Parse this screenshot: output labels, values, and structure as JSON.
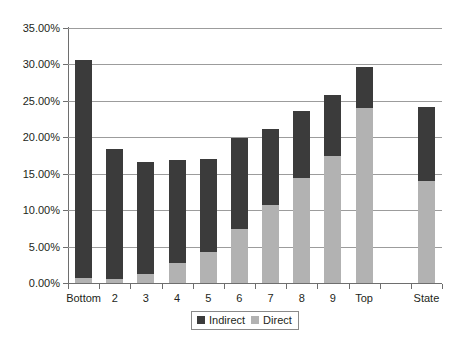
{
  "chart_data": {
    "type": "bar",
    "subtype": "stacked-column",
    "title": "",
    "xlabel": "",
    "ylabel": "",
    "categories": [
      "Bottom",
      "2",
      "3",
      "4",
      "5",
      "6",
      "7",
      "8",
      "9",
      "Top",
      "State"
    ],
    "series": [
      {
        "name": "Direct",
        "color": "#b2b2b2",
        "values": [
          0.7,
          0.5,
          1.2,
          2.7,
          4.2,
          7.4,
          10.7,
          14.4,
          17.5,
          24.0,
          14.0
        ]
      },
      {
        "name": "Indirect",
        "color": "#3b3b3b",
        "values": [
          29.9,
          17.9,
          15.4,
          14.2,
          12.8,
          12.5,
          10.5,
          9.2,
          8.3,
          5.7,
          10.2
        ]
      }
    ],
    "totals": [
      30.6,
      18.4,
      16.6,
      16.9,
      17.0,
      19.9,
      21.2,
      23.6,
      25.8,
      29.7,
      24.2
    ],
    "ylim": [
      0,
      35
    ],
    "ytick_step": 5,
    "ytick_labels": [
      "0.00%",
      "5.00%",
      "10.00%",
      "15.00%",
      "20.00%",
      "25.00%",
      "30.00%",
      "35.00%"
    ],
    "ytick_values": [
      0,
      5,
      10,
      15,
      20,
      25,
      30,
      35
    ],
    "grid": true,
    "grid_axis": "y",
    "legend_position": "bottom",
    "legend_entries": [
      {
        "label": "Indirect",
        "color": "#3b3b3b"
      },
      {
        "label": "Direct",
        "color": "#b2b2b2"
      }
    ],
    "category_gap_before": [
      "State"
    ],
    "background_color": "#ffffff",
    "axis_color": "#6e6e6e",
    "gridline_color": "#9c9c9c"
  }
}
